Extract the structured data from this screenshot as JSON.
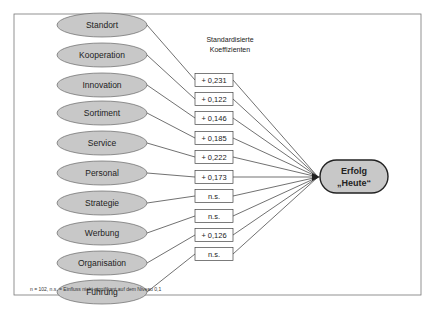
{
  "chart_data": {
    "type": "path_diagram",
    "title": "",
    "header": [
      "Standardisierte",
      "Koeffizienten"
    ],
    "target": [
      "Erfolg",
      "„Heute“"
    ],
    "factors": [
      {
        "name": "Standort",
        "coefficient": "+ 0,231",
        "value": 0.231
      },
      {
        "name": "Kooperation",
        "coefficient": "+ 0,122",
        "value": 0.122
      },
      {
        "name": "Innovation",
        "coefficient": "+ 0,146",
        "value": 0.146
      },
      {
        "name": "Sortiment",
        "coefficient": "+ 0,185",
        "value": 0.185
      },
      {
        "name": "Service",
        "coefficient": "+ 0,222",
        "value": 0.222
      },
      {
        "name": "Personal",
        "coefficient": "+ 0,173",
        "value": 0.173
      },
      {
        "name": "Strategie",
        "coefficient": "n.s.",
        "value": null
      },
      {
        "name": "Werbung",
        "coefficient": "n.s.",
        "value": null
      },
      {
        "name": "Organisation",
        "coefficient": "+ 0,126",
        "value": 0.126
      },
      {
        "name": "Führung",
        "coefficient": "n.s.",
        "value": null
      }
    ],
    "footnote": "n = 102, n.s. = Einfluss nicht signifikant auf dem Niveau 0,1"
  },
  "colors": {
    "ellipse_fill": "#c8c8c8",
    "target_fill": "#c8c8c8",
    "line": "#333333",
    "frame": "#777777"
  }
}
